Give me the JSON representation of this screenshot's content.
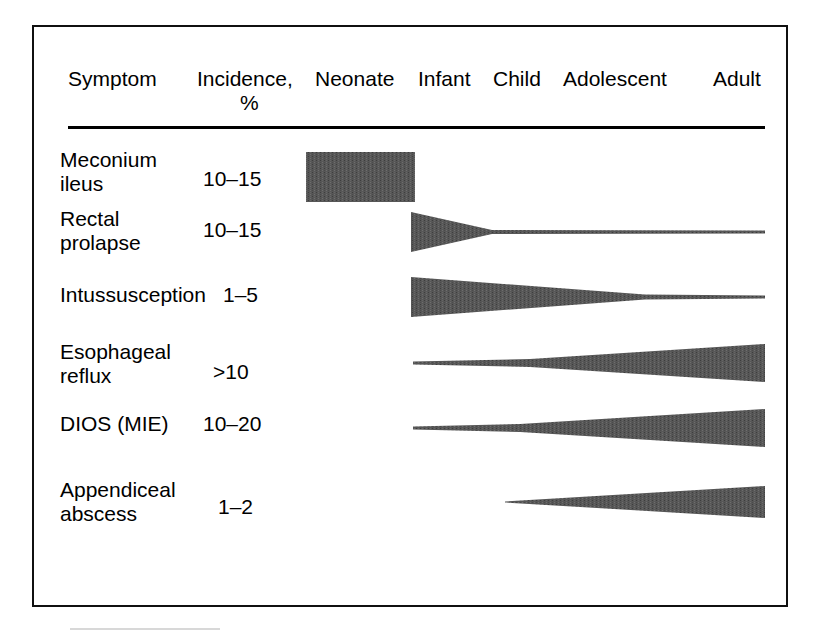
{
  "figure": {
    "type": "clinical-age-distribution-table",
    "columns": [
      "Symptom",
      "Incidence, %",
      "Neonate",
      "Infant",
      "Child",
      "Adolescent",
      "Adult"
    ],
    "header": {
      "symptom": "Symptom",
      "incidence": "Incidence,",
      "percent": "%",
      "neonate": "Neonate",
      "infant": "Infant",
      "child": "Child",
      "adolescent": "Adolescent",
      "adult": "Adult"
    },
    "rows": [
      {
        "symptom": "Meconium\nileus",
        "incidence": "10–15"
      },
      {
        "symptom": "Rectal\nprolapse",
        "incidence": "10–15"
      },
      {
        "symptom": "Intussusception",
        "incidence": "1–5"
      },
      {
        "symptom": "Esophageal\nreflux",
        "incidence": ">10"
      },
      {
        "symptom": "DIOS (MIE)",
        "incidence": "10–20"
      },
      {
        "symptom": "Appendiceal\nabscess",
        "incidence": "1–2"
      }
    ]
  },
  "chart_data": {
    "type": "area",
    "title": "",
    "xlabel": "",
    "ylabel": "",
    "categories": [
      "Neonate",
      "Infant",
      "Child",
      "Adolescent",
      "Adult"
    ],
    "category_x": [
      315,
      418,
      493,
      563,
      713
    ],
    "axis_start_x": 306,
    "axis_end_x": 765,
    "grid": false,
    "legend": "none",
    "note": "Wedge thickness encodes relative symptom prevalence across age groups; incidence column gives overall percent range.",
    "series": [
      {
        "name": "Meconium ileus",
        "incidence": "10–15",
        "shape": "rectangle",
        "age_span": [
          "Neonate"
        ],
        "thickness_profile": [
          {
            "x": 306,
            "half": 25
          },
          {
            "x": 415,
            "half": 25
          }
        ],
        "center_y": 177,
        "fill": "#575757"
      },
      {
        "name": "Rectal prolapse",
        "incidence": "10–15",
        "shape": "wedge-decreasing",
        "age_span": [
          "Infant",
          "Child",
          "Adolescent",
          "Adult"
        ],
        "thickness_profile": [
          {
            "x": 411,
            "half": 20
          },
          {
            "x": 492,
            "half": 2
          },
          {
            "x": 765,
            "half": 1.5
          }
        ],
        "center_y": 232,
        "fill": "#575757"
      },
      {
        "name": "Intussusception",
        "incidence": "1–5",
        "shape": "wedge-decreasing",
        "age_span": [
          "Infant",
          "Child",
          "Adolescent",
          "Adult"
        ],
        "thickness_profile": [
          {
            "x": 411,
            "half": 20
          },
          {
            "x": 645,
            "half": 2.5
          },
          {
            "x": 765,
            "half": 1.5
          }
        ],
        "center_y": 297,
        "fill": "#575757"
      },
      {
        "name": "Esophageal reflux",
        "incidence": ">10",
        "shape": "wedge-increasing",
        "age_span": [
          "Infant",
          "Child",
          "Adolescent",
          "Adult"
        ],
        "thickness_profile": [
          {
            "x": 413,
            "half": 1.5
          },
          {
            "x": 530,
            "half": 4
          },
          {
            "x": 765,
            "half": 19
          }
        ],
        "center_y": 363,
        "fill": "#575757"
      },
      {
        "name": "DIOS (MIE)",
        "incidence": "10–20",
        "shape": "wedge-increasing",
        "age_span": [
          "Infant",
          "Child",
          "Adolescent",
          "Adult"
        ],
        "thickness_profile": [
          {
            "x": 413,
            "half": 1.5
          },
          {
            "x": 520,
            "half": 4
          },
          {
            "x": 765,
            "half": 19
          }
        ],
        "center_y": 428,
        "fill": "#575757"
      },
      {
        "name": "Appendiceal abscess",
        "incidence": "1–2",
        "shape": "wedge-increasing",
        "age_span": [
          "Child",
          "Adolescent",
          "Adult"
        ],
        "thickness_profile": [
          {
            "x": 505,
            "half": 0.5
          },
          {
            "x": 765,
            "half": 16
          }
        ],
        "center_y": 502,
        "fill": "#575757"
      }
    ]
  }
}
